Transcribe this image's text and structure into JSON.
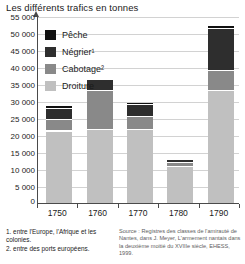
{
  "title": "Les différents trafics en tonnes",
  "footnotes": [
    "1. entre l'Europe, l'Afrique et les colonies.",
    "2. entre des ports européens."
  ],
  "source": "Source : Registres des classes de l'amirauté de Nantes, dans J. Meyer, L'armement nantais dans la deuxième moitié du XVIIIe siècle, EHESS, 1999.",
  "legend": [
    {
      "label": "Pêche",
      "color": "#111111",
      "key": "peche"
    },
    {
      "label": "Négrier¹",
      "color": "#2e2e2e",
      "key": "negrier"
    },
    {
      "label": "Cabotage²",
      "color": "#898989",
      "key": "cabotage"
    },
    {
      "label": "Droiture",
      "color": "#c0c0c0",
      "key": "droiture"
    }
  ],
  "axis": {
    "y_ticks": [
      "0",
      "5 000",
      "10 000",
      "15 000",
      "20 000",
      "25 000",
      "30 000",
      "35 000",
      "40 000",
      "45 000",
      "50 000",
      "55 000"
    ],
    "x_ticks": [
      "1750",
      "1760",
      "1770",
      "1780",
      "1790"
    ]
  },
  "chart_data": {
    "type": "bar",
    "subtype": "stacked",
    "title": "Les différents trafics en tonnes",
    "xlabel": "",
    "ylabel": "tonnes",
    "ylim": [
      0,
      55000
    ],
    "ytick_step": 5000,
    "grid": true,
    "legend_position": "inside-top-left",
    "categories": [
      "1750",
      "1760",
      "1770",
      "1780",
      "1790"
    ],
    "stack_order_bottom_to_top": [
      "Droiture",
      "Cabotage",
      "Négrier",
      "Pêche"
    ],
    "series": [
      {
        "name": "Droiture",
        "color": "#c0c0c0",
        "values": [
          21000,
          21500,
          21500,
          10500,
          33000
        ]
      },
      {
        "name": "Cabotage",
        "color": "#898989",
        "values": [
          3000,
          11000,
          3500,
          1000,
          5500
        ]
      },
      {
        "name": "Négrier",
        "color": "#2e2e2e",
        "values": [
          3000,
          3000,
          3000,
          500,
          12000
        ]
      },
      {
        "name": "Pêche",
        "color": "#111111",
        "values": [
          500,
          0,
          500,
          0,
          500
        ]
      }
    ],
    "totals": [
      27500,
      35500,
      28500,
      12000,
      51000
    ]
  }
}
